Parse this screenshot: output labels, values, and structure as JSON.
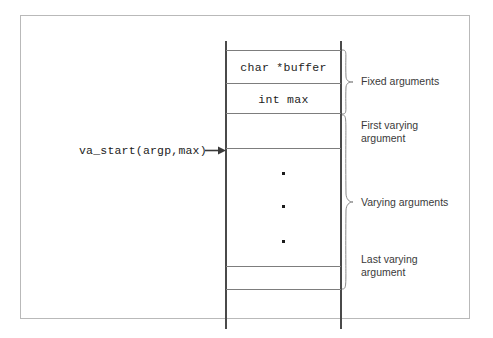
{
  "figure": {
    "type": "stack-frame-diagram"
  },
  "stack": {
    "cells": [
      {
        "id": "cell-top-empty",
        "label": "",
        "code": false
      },
      {
        "id": "cell-char-buffer",
        "label": "char *buffer",
        "code": true
      },
      {
        "id": "cell-int-max",
        "label": "int max",
        "code": true
      },
      {
        "id": "cell-first-varying",
        "label": "",
        "code": false
      },
      {
        "id": "cell-varying-middle",
        "label": "",
        "code": false
      },
      {
        "id": "cell-last-varying",
        "label": "",
        "code": false
      },
      {
        "id": "cell-bottom-empty",
        "label": "",
        "code": false
      }
    ],
    "ellipsis_dots": 3
  },
  "annotations": {
    "va_start": {
      "text": "va_start(argp,max)",
      "arrow_icon": "arrow-right-icon",
      "points_to": "cell-first-varying"
    }
  },
  "braces": [
    {
      "id": "brace-fixed-arguments",
      "icon": "curly-brace-right-icon",
      "label": "Fixed arguments",
      "covers": [
        "cell-char-buffer",
        "cell-int-max"
      ]
    },
    {
      "id": "brace-varying-arguments",
      "icon": "curly-brace-right-icon",
      "label": "Varying arguments",
      "covers": [
        "cell-first-varying",
        "cell-varying-middle",
        "cell-last-varying"
      ]
    }
  ],
  "side_labels": [
    {
      "id": "label-fixed-arguments",
      "text": "Fixed arguments"
    },
    {
      "id": "label-first-varying",
      "text": "First varying\nargument"
    },
    {
      "id": "label-varying-arguments",
      "text": "Varying arguments"
    },
    {
      "id": "label-last-varying",
      "text": "Last varying\nargument"
    }
  ],
  "colors": {
    "frame_border": "#b9b9b9",
    "rail": "#4a4a4a",
    "divider": "#7d7d7d",
    "code_text": "#1c1c1c",
    "label_text": "#3a3a3a",
    "background": "#ffffff"
  }
}
